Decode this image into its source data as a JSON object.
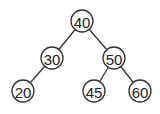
{
  "diagram": {
    "type": "binary-search-tree",
    "nodes": [
      {
        "id": "n40",
        "label": "40",
        "x": 82,
        "y": 21
      },
      {
        "id": "n30",
        "label": "30",
        "x": 52,
        "y": 58
      },
      {
        "id": "n50",
        "label": "50",
        "x": 114,
        "y": 58
      },
      {
        "id": "n20",
        "label": "20",
        "x": 23,
        "y": 91
      },
      {
        "id": "n45",
        "label": "45",
        "x": 94,
        "y": 91
      },
      {
        "id": "n60",
        "label": "60",
        "x": 140,
        "y": 91
      }
    ],
    "edges": [
      {
        "from": "40",
        "to": "30"
      },
      {
        "from": "40",
        "to": "50"
      },
      {
        "from": "30",
        "to": "20"
      },
      {
        "from": "50",
        "to": "45"
      },
      {
        "from": "50",
        "to": "60"
      }
    ],
    "node_radius": 11,
    "colors": {
      "stroke": "#333333",
      "fill": "#ffffff",
      "text": "#222222"
    }
  }
}
